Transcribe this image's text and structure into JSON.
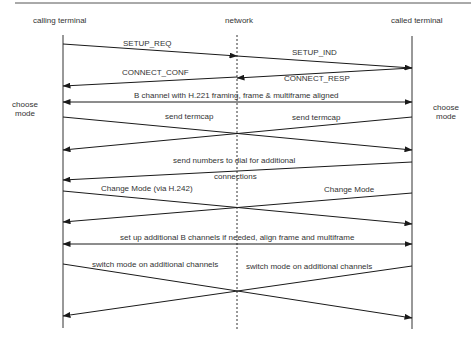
{
  "participants": {
    "left": "calling terminal",
    "middle": "network",
    "right": "called terminal"
  },
  "side_notes": {
    "left": [
      "choose",
      "mode"
    ],
    "right": [
      "choose",
      "mode"
    ]
  },
  "messages": [
    {
      "id": "setup_req",
      "label": "SETUP_REQ",
      "from": "calling terminal",
      "to": "network"
    },
    {
      "id": "setup_ind",
      "label": "SETUP_IND",
      "from": "network",
      "to": "called terminal"
    },
    {
      "id": "connect_resp",
      "label": "CONNECT_RESP",
      "from": "called terminal",
      "to": "network"
    },
    {
      "id": "connect_conf",
      "label": "CONNECT_CONF",
      "from": "network",
      "to": "calling terminal"
    },
    {
      "id": "b_channel",
      "label": "B channel with H.221 framing, frame & multiframe aligned",
      "from": "both",
      "to": "both"
    },
    {
      "id": "send_termcap_left",
      "label": "send termcap",
      "from": "calling terminal",
      "to": "called terminal"
    },
    {
      "id": "send_termcap_right",
      "label": "send termcap",
      "from": "called terminal",
      "to": "calling terminal"
    },
    {
      "id": "send_numbers",
      "label_line1": "send numbers to dial for additional",
      "label_line2": "connections",
      "from": "called terminal",
      "to": "calling terminal"
    },
    {
      "id": "change_mode_left",
      "label": "Change Mode (via H.242)",
      "from": "calling terminal",
      "to": "called terminal"
    },
    {
      "id": "change_mode_right",
      "label": "Change  Mode",
      "from": "called terminal",
      "to": "calling terminal"
    },
    {
      "id": "setup_additional",
      "label": "set up additional B channels if needed, align frame and multiframe",
      "from": "both",
      "to": "both"
    },
    {
      "id": "switch_mode_left",
      "label": "switch mode on additional channels",
      "from": "calling terminal",
      "to": "called terminal"
    },
    {
      "id": "switch_mode_right",
      "label": "switch mode on additional channels",
      "from": "called terminal",
      "to": "calling terminal"
    }
  ],
  "colors": {
    "line": "#1a1a1a",
    "text": "#333333",
    "rule": "#555555"
  }
}
